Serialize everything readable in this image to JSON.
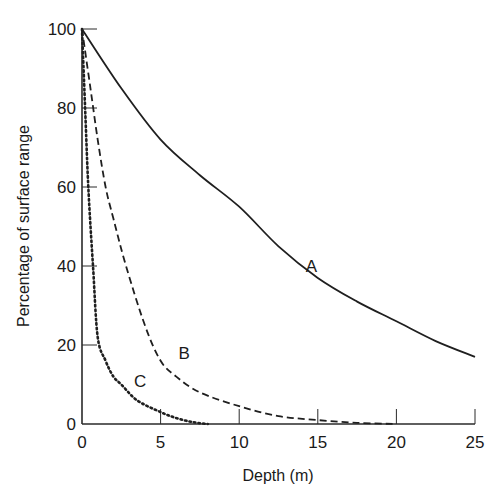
{
  "chart_data": {
    "type": "line",
    "title": "",
    "xlabel": "Depth (m)",
    "ylabel": "Percentage of surface range",
    "xlim": [
      0,
      25
    ],
    "ylim": [
      0,
      100
    ],
    "xticks": [
      0,
      5,
      10,
      15,
      20,
      25
    ],
    "yticks": [
      0,
      20,
      40,
      60,
      80,
      100
    ],
    "grid": false,
    "legend": "none (curves labeled inline)",
    "series": [
      {
        "name": "A",
        "style": "solid",
        "x": [
          0,
          2.5,
          5,
          7.5,
          10,
          12.5,
          15,
          17.5,
          20,
          22.5,
          25
        ],
        "values": [
          100,
          85,
          72,
          63,
          55,
          45,
          37,
          31,
          26,
          21,
          17
        ],
        "label_pos": [
          14.6,
          40
        ]
      },
      {
        "name": "B",
        "style": "dashed",
        "x": [
          0,
          0.5,
          1,
          1.5,
          2,
          2.8,
          4,
          5,
          6,
          7.5,
          10,
          12.5,
          15,
          17.5,
          20
        ],
        "values": [
          100,
          86,
          72,
          60,
          52,
          40,
          25,
          16,
          12,
          8,
          4.5,
          2,
          1,
          0.3,
          0
        ],
        "label_pos": [
          6.5,
          18
        ]
      },
      {
        "name": "C",
        "style": "dotted",
        "x": [
          0,
          0.2,
          0.4,
          0.7,
          1,
          1.5,
          2,
          2.5,
          3.5,
          5,
          6,
          7,
          8
        ],
        "values": [
          100,
          80,
          60,
          40,
          22,
          16,
          12,
          10,
          6,
          3,
          1.5,
          0.5,
          0
        ],
        "label_pos": [
          3.7,
          11
        ]
      }
    ]
  }
}
